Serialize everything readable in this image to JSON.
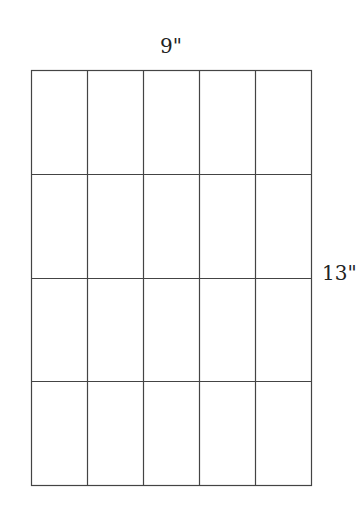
{
  "diagram": {
    "width_label": "9\"",
    "height_label": "13\"",
    "grid": {
      "columns": 5,
      "rows": 4,
      "x": 31,
      "y": 70,
      "width": 280,
      "height": 415,
      "line_color": "#444444"
    }
  }
}
